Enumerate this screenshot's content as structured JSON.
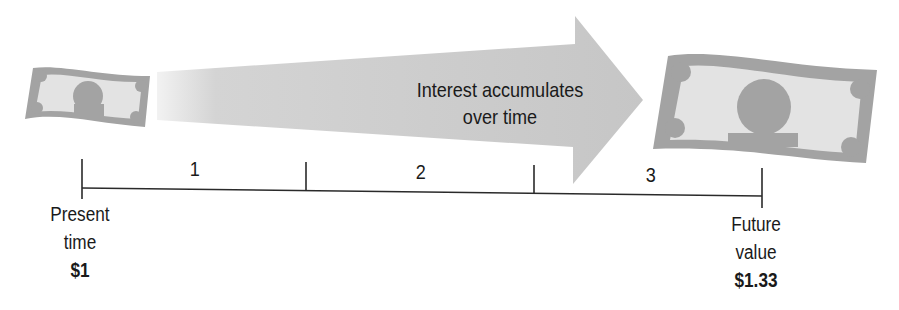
{
  "diagram": {
    "arrow": {
      "label_line1": "Interest accumulates",
      "label_line2": "over time",
      "color": "#c4c4c4"
    },
    "timeline": {
      "periods": [
        "1",
        "2",
        "3"
      ],
      "start": {
        "line1": "Present",
        "line2": "time",
        "value": "$1"
      },
      "end": {
        "line1": "Future",
        "line2": "value",
        "value": "$1.33"
      }
    },
    "icons": {
      "small_bill": "dollar-bill-icon",
      "large_bill": "dollar-bill-icon",
      "bill_color": "#9e9e9e",
      "bill_fill": "#e6e6e6"
    }
  }
}
